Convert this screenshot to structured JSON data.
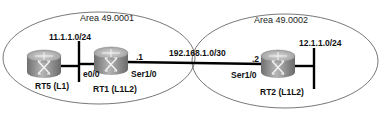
{
  "areas": [
    {
      "id": "area1",
      "label": "Area 49.0001"
    },
    {
      "id": "area2",
      "label": "Area 49.0002"
    }
  ],
  "routers": [
    {
      "id": "rt5",
      "label": "RT5 (L1)"
    },
    {
      "id": "rt1",
      "label": "RT1 (L1L2)"
    },
    {
      "id": "rt2",
      "label": "RT2 (L1L2)"
    }
  ],
  "networks": {
    "lan1": "11.1.1.0/24",
    "lan2": "12.1.1.0/24",
    "serial_link": "192.168.1.0/30"
  },
  "interfaces": {
    "rt1_e0": "e0/0",
    "rt1_ser": "Ser1/0",
    "rt1_ser_host": ".1",
    "rt2_ser": "Ser1/0",
    "rt2_ser_host": ".2"
  },
  "colors": {
    "router_body": "#8a8a8a",
    "link": "#000000",
    "ellipse": "#555555"
  }
}
